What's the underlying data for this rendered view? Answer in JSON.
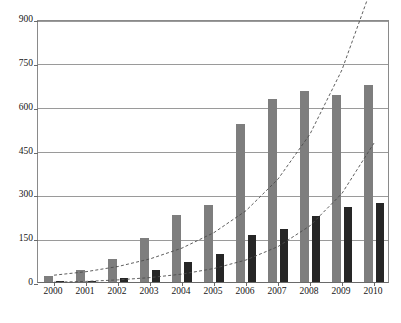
{
  "chart_data": {
    "type": "bar",
    "title": "",
    "subtitle": "",
    "xlabel": "",
    "ylabel": "",
    "categories": [
      "2000",
      "2001",
      "2002",
      "2003",
      "2004",
      "2005",
      "2006",
      "2007",
      "2008",
      "2009",
      "2010"
    ],
    "series": [
      {
        "name": "series-gray",
        "color": "#7e7e7e",
        "values": [
          20,
          40,
          80,
          150,
          230,
          265,
          540,
          625,
          655,
          640,
          675
        ]
      },
      {
        "name": "series-black",
        "color": "#262626",
        "values": [
          5,
          5,
          15,
          40,
          70,
          95,
          160,
          180,
          225,
          255,
          270
        ]
      }
    ],
    "trendlines": [
      {
        "name": "trendline-gray",
        "style": "dashed",
        "color": "#4d4d4d",
        "fit": "exponential",
        "points": [
          [
            0,
            30
          ],
          [
            1,
            42
          ],
          [
            2,
            60
          ],
          [
            3,
            86
          ],
          [
            4,
            123
          ],
          [
            5,
            176
          ],
          [
            6,
            251
          ],
          [
            7,
            359
          ],
          [
            8,
            513
          ],
          [
            9,
            733
          ],
          [
            10,
            1048
          ]
        ]
      },
      {
        "name": "trendline-black",
        "style": "dashed",
        "color": "#4d4d4d",
        "fit": "exponential",
        "points": [
          [
            0,
            6
          ],
          [
            1,
            9
          ],
          [
            2,
            14
          ],
          [
            3,
            22
          ],
          [
            4,
            34
          ],
          [
            5,
            53
          ],
          [
            6,
            82
          ],
          [
            7,
            128
          ],
          [
            8,
            199
          ],
          [
            9,
            310
          ],
          [
            10,
            482
          ]
        ]
      }
    ],
    "yticks": [
      "0",
      "150",
      "300",
      "450",
      "600",
      "750",
      "900"
    ],
    "ytick_values": [
      0,
      150,
      300,
      450,
      600,
      750,
      900
    ],
    "ylim": [
      0,
      900
    ],
    "grid": true,
    "legend": "none"
  },
  "axes": {
    "y_labels": [
      "900",
      "750",
      "600",
      "450",
      "300",
      "150",
      "0"
    ],
    "x_labels": [
      "2000",
      "2001",
      "2002",
      "2003",
      "2004",
      "2005",
      "2006",
      "2007",
      "2008",
      "2009",
      "2010"
    ]
  },
  "colors": {
    "series_gray": "#7e7e7e",
    "series_black": "#262626",
    "gridline": "#9a9a9a",
    "axis": "#6a6a6a",
    "trendline": "#4d4d4d",
    "background": "#ffffff",
    "text": "#151515"
  }
}
